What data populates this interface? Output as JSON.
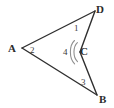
{
  "figure": {
    "kind": "geometry-diagram",
    "background_color": "#ffffff",
    "stroke_color": "#2f2f2f",
    "arc_color": "#8a8a8a",
    "stroke_width": 1.4,
    "vertices": [
      {
        "id": "A",
        "label": "A",
        "x": 22,
        "y": 48
      },
      {
        "id": "D",
        "label": "D",
        "x": 95,
        "y": 11
      },
      {
        "id": "C",
        "label": "C",
        "x": 80,
        "y": 52
      },
      {
        "id": "B",
        "label": "B",
        "x": 97,
        "y": 95
      }
    ],
    "edges": [
      {
        "from": "A",
        "to": "D"
      },
      {
        "from": "D",
        "to": "C"
      },
      {
        "from": "C",
        "to": "B"
      },
      {
        "from": "B",
        "to": "A"
      }
    ],
    "angle_labels": [
      {
        "id": "1",
        "label": "1",
        "at_vertex": "D"
      },
      {
        "id": "2",
        "label": "2",
        "at_vertex": "A"
      },
      {
        "id": "3",
        "label": "3",
        "at_vertex": "B"
      },
      {
        "id": "4",
        "label": "4",
        "at_vertex": "C",
        "note": "reflex angle, arc drawn"
      }
    ],
    "arcs": [
      {
        "at_vertex": "C",
        "for_angle": "4",
        "type": "double-arc"
      }
    ]
  }
}
